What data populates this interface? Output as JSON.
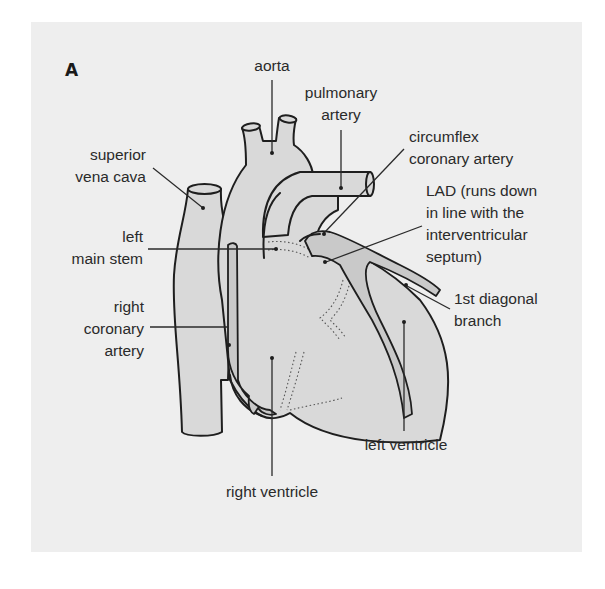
{
  "figure": {
    "panel_label": "A",
    "colors": {
      "panel_background": "#eeeeee",
      "heart_fill": "#d9d9d9",
      "artery_fill": "#c9c9c9",
      "outline": "#1e1e1e",
      "text": "#2a2a2a"
    },
    "labels": {
      "aorta": "aorta",
      "pulmonary_artery": [
        "pulmonary",
        "artery"
      ],
      "superior_vena_cava": [
        "superior",
        "vena cava"
      ],
      "circumflex": [
        "circumflex",
        "coronary artery"
      ],
      "lad": [
        "LAD (runs down",
        "in line with the",
        "interventricular",
        "septum)"
      ],
      "left_main_stem": [
        "left",
        "main stem"
      ],
      "first_diagonal": [
        "1st diagonal",
        "branch"
      ],
      "right_coronary_artery": [
        "right",
        "coronary",
        "artery"
      ],
      "left_ventricle": "left ventricle",
      "right_ventricle": "right ventricle"
    }
  }
}
